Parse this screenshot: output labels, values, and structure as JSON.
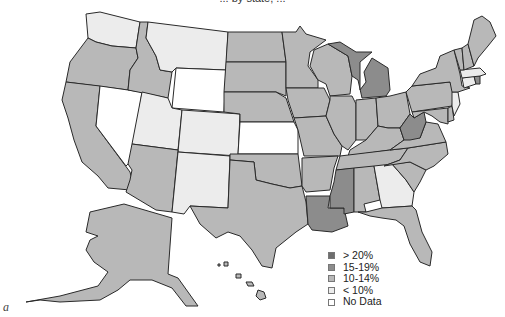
{
  "title_partial": "... by state, ...",
  "caption_label": "a",
  "colors": {
    "gt20": "#6e6e6e",
    "p15_19": "#8c8c8c",
    "p10_14": "#b8b8b8",
    "lt10": "#ececec",
    "no_data": "#ffffff",
    "border": "#2a2a2a"
  },
  "legend": {
    "items": [
      {
        "label": "> 20%",
        "color": "#6e6e6e"
      },
      {
        "label": "15-19%",
        "color": "#8c8c8c"
      },
      {
        "label": "10-14%",
        "color": "#b8b8b8"
      },
      {
        "label": "< 10%",
        "color": "#ececec"
      },
      {
        "label": "No Data",
        "color": "#ffffff"
      }
    ]
  },
  "states": {
    "WA": "lt10",
    "OR": "p10_14",
    "CA": "p10_14",
    "NV": "no_data",
    "ID": "p10_14",
    "MT": "lt10",
    "WY": "no_data",
    "UT": "lt10",
    "CO": "lt10",
    "AZ": "p10_14",
    "NM": "lt10",
    "ND": "p10_14",
    "SD": "p10_14",
    "NE": "p10_14",
    "KS": "no_data",
    "OK": "p10_14",
    "TX": "p10_14",
    "MN": "p10_14",
    "IA": "p10_14",
    "MO": "p10_14",
    "AR": "p10_14",
    "LA": "p15_19",
    "WI": "p10_14",
    "IL": "p10_14",
    "MI": "p15_19",
    "IN": "p10_14",
    "OH": "p10_14",
    "KY": "p10_14",
    "TN": "p10_14",
    "MS": "p15_19",
    "AL": "p10_14",
    "GA": "lt10",
    "FL": "p10_14",
    "SC": "p10_14",
    "NC": "p10_14",
    "VA": "p10_14",
    "WV": "p15_19",
    "PA": "p10_14",
    "NY": "p10_14",
    "VT": "p10_14",
    "NH": "p10_14",
    "ME": "p10_14",
    "MA": "lt10",
    "RI": "p15_19",
    "CT": "lt10",
    "NJ": "lt10",
    "DE": "p10_14",
    "MD": "p10_14",
    "AK": "p10_14",
    "HI": "p10_14"
  }
}
